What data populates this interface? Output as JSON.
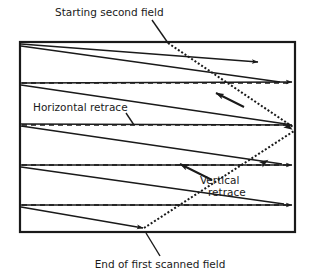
{
  "figure": {
    "type": "diagram",
    "background_color": "#ffffff",
    "line_color": "#1a1a1a",
    "canvas": {
      "width": 313,
      "height": 275
    }
  },
  "screen_frame": {
    "name": "raster-screen-border",
    "x": 20,
    "y": 42,
    "width": 275,
    "height": 190,
    "stroke_width": 2.2,
    "stroke_color": "#1a1a1a"
  },
  "labels": {
    "starting_second_field": {
      "text": "Starting second field",
      "x": 55,
      "y": 16,
      "anchor": "start"
    },
    "horizontal_retrace": {
      "text": "Horizontal  retrace",
      "x": 33,
      "y": 111,
      "anchor": "start"
    },
    "vertical_retrace_line1": {
      "text": "Vertical",
      "x": 200,
      "y": 184,
      "anchor": "start"
    },
    "vertical_retrace_line2": {
      "text": "retrace",
      "x": 208,
      "y": 196,
      "anchor": "start"
    },
    "end_of_first_scanned_field": {
      "text": "End of first scanned field",
      "x": 160,
      "y": 268,
      "anchor": "middle"
    }
  },
  "leader_lines": [
    {
      "name": "leader-starting-second-field",
      "x1": 152,
      "y1": 20,
      "x2": 168,
      "y2": 43,
      "width": 1.4
    },
    {
      "name": "leader-horizontal-retrace",
      "x1": 126,
      "y1": 113,
      "x2": 134,
      "y2": 125,
      "width": 1.4
    },
    {
      "name": "leader-end-of-first-scanned-field",
      "x1": 160,
      "y1": 256,
      "x2": 146,
      "y2": 233,
      "width": 1.4
    }
  ],
  "scan_lines": [
    {
      "name": "scan-line-1",
      "x1": 21,
      "y1": 44,
      "x2": 258,
      "y2": 62,
      "arrow": true
    },
    {
      "name": "scan-line-2",
      "x1": 21,
      "y1": 83,
      "x2": 292,
      "y2": 82,
      "arrow": true
    },
    {
      "name": "scan-line-3",
      "x1": 21,
      "y1": 124,
      "x2": 292,
      "y2": 125,
      "arrow": true
    },
    {
      "name": "scan-line-4",
      "x1": 21,
      "y1": 165,
      "x2": 292,
      "y2": 165,
      "arrow": true
    },
    {
      "name": "scan-line-5",
      "x1": 21,
      "y1": 205,
      "x2": 292,
      "y2": 205,
      "arrow": true
    }
  ],
  "scan_lines_lower": [
    {
      "name": "scan-line-1b",
      "x1": 21,
      "y1": 46,
      "x2": 280,
      "y2": 82,
      "arrow": false
    },
    {
      "name": "scan-line-2b",
      "x1": 21,
      "y1": 85,
      "x2": 286,
      "y2": 124,
      "arrow": false
    },
    {
      "name": "scan-line-3b",
      "x1": 21,
      "y1": 126,
      "x2": 282,
      "y2": 164,
      "arrow": false
    },
    {
      "name": "scan-line-4b",
      "x1": 21,
      "y1": 167,
      "x2": 284,
      "y2": 204,
      "arrow": false
    },
    {
      "name": "scan-line-5b",
      "x1": 21,
      "y1": 207,
      "x2": 143,
      "y2": 228,
      "arrow": true
    }
  ],
  "retrace_lines": [
    {
      "name": "horizontal-retrace-1",
      "y": 83,
      "x1": 22,
      "x2": 291
    },
    {
      "name": "horizontal-retrace-2",
      "y": 125,
      "x1": 22,
      "x2": 291
    },
    {
      "name": "horizontal-retrace-3",
      "y": 165,
      "x1": 22,
      "x2": 291
    },
    {
      "name": "horizontal-retrace-4",
      "y": 205,
      "x1": 22,
      "x2": 291
    }
  ],
  "vertical_retrace": {
    "segment_down": {
      "name": "vertical-retrace-down",
      "x1": 168,
      "y1": 43,
      "x2": 293,
      "y2": 127,
      "dash": "2,2",
      "width": 2.0
    },
    "segment_up": {
      "name": "vertical-retrace-up",
      "x1": 144,
      "y1": 228,
      "x2": 294,
      "y2": 131,
      "dash": "2,2",
      "width": 2.0
    },
    "arrow_mid_down": {
      "name": "vertical-retrace-arrow-down",
      "x": 287,
      "y": 122,
      "angle": 34
    },
    "arrow_mid_up": {
      "name": "vertical-retrace-arrow-up",
      "x": 259,
      "y": 162,
      "angle": -33
    }
  },
  "pointer_arrows": [
    {
      "name": "pointer-arrow-upper",
      "x1": 244,
      "y1": 107,
      "x2": 216,
      "y2": 93
    },
    {
      "name": "pointer-arrow-lower",
      "x1": 212,
      "y1": 180,
      "x2": 180,
      "y2": 164
    }
  ]
}
